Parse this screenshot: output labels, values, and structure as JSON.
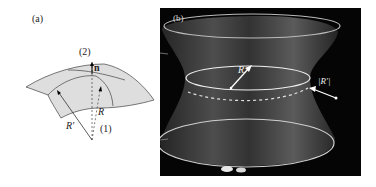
{
  "panel_a": {
    "label": "(a)",
    "point_top": "(2)",
    "point_bottom": "(1)",
    "normal_label": "n",
    "radius_label": "R",
    "radius_prime_label": "R'",
    "surface_color": "#dedede"
  },
  "panel_b": {
    "label": "(b)",
    "radius_label": "R",
    "radius_prime_label": "|R'|",
    "background_color": "#050505"
  }
}
